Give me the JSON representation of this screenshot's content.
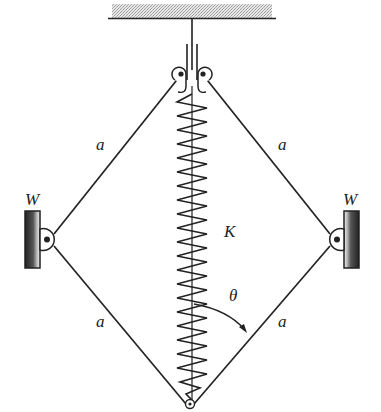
{
  "diagram": {
    "title": "",
    "labels": {
      "bar_upper_left": "a",
      "bar_upper_right": "a",
      "bar_lower_left": "a",
      "bar_lower_right": "a",
      "weight_left": "W",
      "weight_right": "W",
      "spring": "K",
      "angle": "θ"
    },
    "geometry": {
      "ceiling": {
        "x1": 112,
        "x2": 272,
        "y": 18
      },
      "top_hinge": {
        "x": 190,
        "y": 68
      },
      "left_hinge": {
        "x": 48,
        "y": 239
      },
      "right_hinge": {
        "x": 336,
        "y": 239
      },
      "bottom_hinge": {
        "x": 190,
        "y": 408
      },
      "spring_coils": 22
    },
    "colors": {
      "ink": "#222222",
      "ceiling_hatch": "#b8b8b8",
      "background": "#ffffff"
    }
  }
}
